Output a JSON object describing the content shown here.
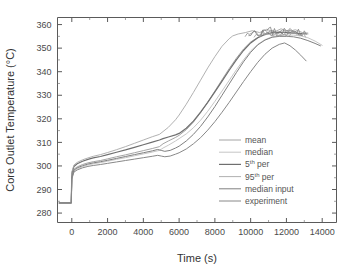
{
  "chart_data": {
    "type": "line",
    "title": "",
    "xlabel": "Time (s)",
    "ylabel": "Core Outlet Temperature (°C)",
    "xlim": [
      -800,
      14800
    ],
    "ylim": [
      276,
      363
    ],
    "xticks": [
      0,
      2000,
      4000,
      6000,
      8000,
      10000,
      12000,
      14000
    ],
    "xtick_labels": [
      "0",
      "2000",
      "4000",
      "6000",
      "8000",
      "10000",
      "12000",
      "14000"
    ],
    "yticks": [
      280,
      290,
      300,
      310,
      320,
      330,
      340,
      350,
      360
    ],
    "ytick_labels": [
      "280",
      "290",
      "300",
      "310",
      "320",
      "330",
      "340",
      "350",
      "360"
    ],
    "grid": false,
    "legend_position": "center-right",
    "series": [
      {
        "name": "mean",
        "color": "#9a9a9a",
        "width": 0.9,
        "x": [
          -700,
          -30,
          0,
          120,
          300,
          600,
          900,
          1200,
          1600,
          2000,
          2500,
          3000,
          3500,
          4000,
          4500,
          4900,
          5100,
          5400,
          5800,
          6000,
          6400,
          6800,
          7200,
          7600,
          8000,
          8400,
          8800,
          9200,
          9600,
          10000,
          10300,
          10600,
          10900,
          11200,
          11500,
          11800,
          12100,
          12400,
          12700,
          13000,
          13200
        ],
        "y": [
          284.3,
          284.3,
          295.5,
          298.6,
          299.6,
          300.6,
          301.3,
          301.8,
          302.3,
          303.0,
          303.9,
          304.7,
          305.6,
          306.5,
          307.4,
          308.2,
          309.4,
          310.6,
          312.1,
          313.0,
          315.4,
          318.6,
          322.6,
          327.1,
          331.8,
          336.6,
          341.3,
          345.7,
          349.6,
          352.6,
          354.1,
          355.3,
          356.4,
          357.6,
          356.4,
          357.8,
          356.2,
          357.3,
          356.2,
          356.3,
          356.0
        ]
      },
      {
        "name": "median",
        "color": "#c0c0c0",
        "width": 0.9,
        "x": [
          -700,
          -30,
          0,
          120,
          300,
          600,
          900,
          1200,
          1600,
          2000,
          2500,
          3000,
          3500,
          4000,
          4500,
          4900,
          5100,
          5400,
          5800,
          6000,
          6400,
          6800,
          7200,
          7600,
          8000,
          8400,
          8800,
          9200,
          9600,
          10000,
          10400,
          10800,
          11200,
          11600,
          12000,
          12400,
          12800,
          13200,
          13600,
          14000
        ],
        "y": [
          284.3,
          284.3,
          294.8,
          297.8,
          298.8,
          299.7,
          300.4,
          300.9,
          301.4,
          302.0,
          302.8,
          303.5,
          304.3,
          305.1,
          305.9,
          306.6,
          307.6,
          308.8,
          310.6,
          311.6,
          313.6,
          316.2,
          319.4,
          323.2,
          327.4,
          331.8,
          336.3,
          340.8,
          345.0,
          348.8,
          351.6,
          353.6,
          354.8,
          355.4,
          355.6,
          355.5,
          355.2,
          354.4,
          353.0,
          351.2
        ]
      },
      {
        "name": "5th per",
        "color": "#6f6f6f",
        "width": 1.2,
        "x": [
          -700,
          -30,
          0,
          120,
          300,
          600,
          900,
          1200,
          1600,
          2000,
          2500,
          3000,
          3500,
          4000,
          4500,
          4900,
          5100,
          5400,
          5800,
          6000,
          6400,
          6800,
          7200,
          7600,
          8000,
          8400,
          8800,
          9200,
          9600,
          10000,
          10400,
          10800,
          11200,
          11600,
          12000,
          12400,
          12800,
          13100
        ],
        "y": [
          284.3,
          284.3,
          296.8,
          299.8,
          300.9,
          302.0,
          302.8,
          303.4,
          304.0,
          304.8,
          305.8,
          306.8,
          307.9,
          309.0,
          310.1,
          311.0,
          311.6,
          312.3,
          313.2,
          313.8,
          316.0,
          319.0,
          322.8,
          327.0,
          331.4,
          336.0,
          340.6,
          345.0,
          349.0,
          352.2,
          354.4,
          355.8,
          356.6,
          356.8,
          356.6,
          356.4,
          356.2,
          356.0
        ]
      },
      {
        "name": "95th per",
        "color": "#a8a8a8",
        "width": 0.9,
        "x": [
          -700,
          -30,
          0,
          120,
          300,
          600,
          900,
          1200,
          1600,
          2000,
          2500,
          3000,
          3500,
          4000,
          4500,
          4900,
          5100,
          5400,
          5800,
          6000,
          6400,
          6800,
          7200,
          7600,
          8000,
          8400,
          8800,
          9000,
          9300,
          9700,
          10100,
          10500,
          10900,
          11300,
          11700,
          12100,
          12500,
          12900,
          13200
        ],
        "y": [
          284.3,
          284.3,
          297.4,
          300.4,
          301.5,
          302.6,
          303.4,
          304.1,
          304.8,
          305.7,
          306.9,
          308.2,
          309.6,
          311.0,
          312.4,
          313.4,
          314.6,
          316.4,
          319.6,
          321.6,
          326.2,
          331.2,
          336.4,
          341.6,
          346.4,
          350.8,
          354.0,
          355.2,
          356.0,
          356.6,
          357.4,
          356.6,
          358.0,
          356.8,
          358.2,
          357.0,
          357.8,
          356.6,
          356.4
        ]
      },
      {
        "name": "median input",
        "color": "#808080",
        "width": 1.0,
        "x": [
          -700,
          -30,
          0,
          120,
          300,
          600,
          900,
          1200,
          1600,
          2000,
          2500,
          3000,
          3500,
          4000,
          4500,
          4800,
          5000,
          5200,
          5500,
          5800,
          6000,
          6400,
          6800,
          7200,
          7600,
          8000,
          8400,
          8800,
          9200,
          9600,
          10000,
          10400,
          10800,
          11200,
          11600,
          12000,
          12400,
          12800,
          13200,
          13600,
          13900
        ],
        "y": [
          284.3,
          284.3,
          295.2,
          298.2,
          299.2,
          300.1,
          300.8,
          301.3,
          301.8,
          302.4,
          303.2,
          304.0,
          304.8,
          305.6,
          306.4,
          307.0,
          306.6,
          306.2,
          306.6,
          307.6,
          308.4,
          310.6,
          313.4,
          316.8,
          320.8,
          325.2,
          330.0,
          334.8,
          339.6,
          344.2,
          348.2,
          351.4,
          353.4,
          354.6,
          355.0,
          355.0,
          354.8,
          354.2,
          353.2,
          352.0,
          351.0
        ]
      },
      {
        "name": "experiment",
        "color": "#888888",
        "width": 1.0,
        "x": [
          -700,
          -30,
          0,
          120,
          300,
          600,
          900,
          1200,
          1600,
          2000,
          2500,
          3000,
          3500,
          4000,
          4500,
          4800,
          5000,
          5200,
          5500,
          5800,
          6000,
          6400,
          6800,
          7200,
          7600,
          8000,
          8400,
          8800,
          9200,
          9600,
          10000,
          10400,
          10800,
          11200,
          11600,
          11900,
          12200,
          12500,
          12800,
          13100
        ],
        "y": [
          284.3,
          284.3,
          294.4,
          297.4,
          298.3,
          299.2,
          299.8,
          300.2,
          300.6,
          301.1,
          301.7,
          302.3,
          302.9,
          303.5,
          304.1,
          304.5,
          304.2,
          303.9,
          304.2,
          305.0,
          305.6,
          307.2,
          309.4,
          312.0,
          315.2,
          318.8,
          322.8,
          327.0,
          331.4,
          335.8,
          340.0,
          344.0,
          347.4,
          350.0,
          351.6,
          352.2,
          351.0,
          349.2,
          347.0,
          344.6
        ]
      }
    ],
    "annotations": []
  },
  "legend": {
    "entries": [
      {
        "label": "mean",
        "sup": "",
        "label_tail": ""
      },
      {
        "label": "median",
        "sup": "",
        "label_tail": ""
      },
      {
        "label": "5",
        "sup": "th",
        "label_tail": " per"
      },
      {
        "label": "95",
        "sup": "th",
        "label_tail": " per"
      },
      {
        "label": "median input",
        "sup": "",
        "label_tail": ""
      },
      {
        "label": "experiment",
        "sup": "",
        "label_tail": ""
      }
    ]
  },
  "axes": {
    "x_title": "Time (s)",
    "y_title": "Core Outlet Temperature (°C)"
  },
  "colors": {
    "background": "#ffffff",
    "axis": "#5a5a5a",
    "text": "#3a3a3a"
  }
}
